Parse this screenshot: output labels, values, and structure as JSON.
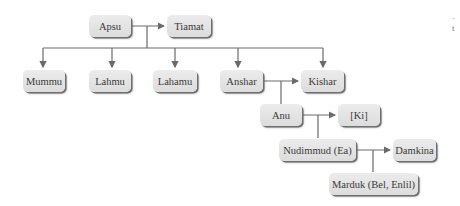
{
  "diagram": {
    "type": "genealogy-tree",
    "nodes": {
      "apsu": "Apsu",
      "tiamat": "Tiamat",
      "mummu": "Mummu",
      "lahmu": "Lahmu",
      "lahamu": "Lahamu",
      "anshar": "Anshar",
      "kishar": "Kishar",
      "anu": "Anu",
      "ki": "[Ki]",
      "nudimmud": "Nudimmud (Ea)",
      "damkina": "Damkina",
      "marduk": "Marduk (Bel, Enlil)"
    },
    "edges": [
      {
        "from": "Apsu",
        "to": "Tiamat",
        "kind": "spouse"
      },
      {
        "from": "Apsu+Tiamat",
        "to": "Mummu",
        "kind": "child"
      },
      {
        "from": "Apsu+Tiamat",
        "to": "Lahmu",
        "kind": "child"
      },
      {
        "from": "Apsu+Tiamat",
        "to": "Lahamu",
        "kind": "child"
      },
      {
        "from": "Apsu+Tiamat",
        "to": "Anshar",
        "kind": "child"
      },
      {
        "from": "Apsu+Tiamat",
        "to": "Kishar",
        "kind": "child"
      },
      {
        "from": "Anshar",
        "to": "Kishar",
        "kind": "spouse"
      },
      {
        "from": "Anshar+Kishar",
        "to": "Anu",
        "kind": "child"
      },
      {
        "from": "Anu",
        "to": "[Ki]",
        "kind": "spouse"
      },
      {
        "from": "Anu+[Ki]",
        "to": "Nudimmud (Ea)",
        "kind": "child"
      },
      {
        "from": "Nudimmud (Ea)",
        "to": "Damkina",
        "kind": "spouse"
      },
      {
        "from": "Nudimmud (Ea)+Damkina",
        "to": "Marduk (Bel, Enlil)",
        "kind": "child"
      }
    ],
    "edge_fragment": {
      "line1": "·",
      "line2": "t"
    },
    "colors": {
      "node_fill": "#e4e4e4",
      "node_shadow": "#6f6f6f",
      "line": "#6a6a6a",
      "text": "#3a3a3a"
    }
  }
}
